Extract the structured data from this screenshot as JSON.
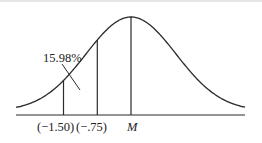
{
  "diagram": {
    "title": "",
    "type": "normal-distribution-curve",
    "area_label": "15.98%",
    "markers": [
      {
        "id": "z-neg-1-50",
        "label": "(−1.50)",
        "z": -1.5
      },
      {
        "id": "z-neg-0-75",
        "label": "(−.75)",
        "z": -0.75
      },
      {
        "id": "mean",
        "label": "M",
        "z": 0
      }
    ],
    "colors": {
      "stroke": "#2b2b2b",
      "background": "#ffffff"
    }
  }
}
